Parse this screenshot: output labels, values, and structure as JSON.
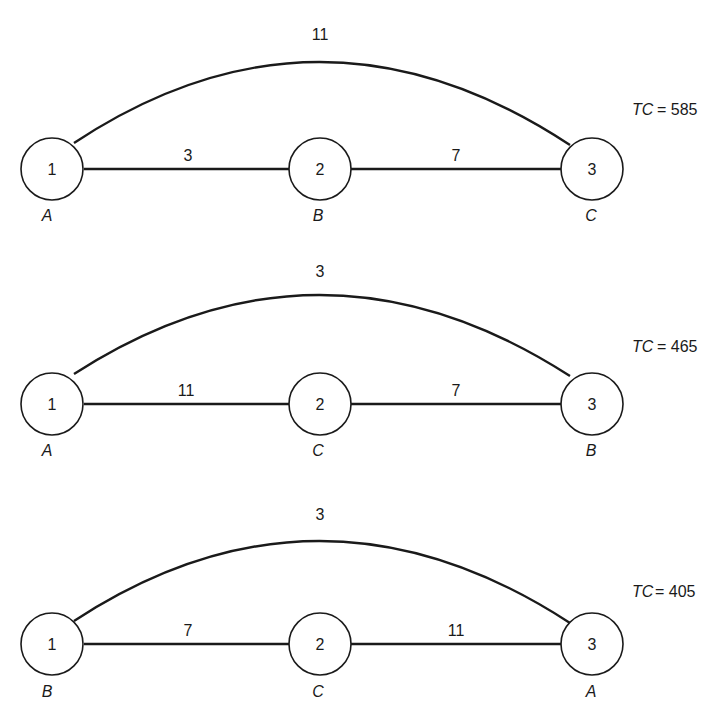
{
  "diagrams": [
    {
      "nodes": [
        {
          "number": "1",
          "letter": "A"
        },
        {
          "number": "2",
          "letter": "B"
        },
        {
          "number": "3",
          "letter": "C"
        }
      ],
      "edges": {
        "one_two": "3",
        "two_three": "7",
        "arc": "11"
      },
      "tc_label": "TC",
      "tc_eq": "= 585"
    },
    {
      "nodes": [
        {
          "number": "1",
          "letter": "A"
        },
        {
          "number": "2",
          "letter": "C"
        },
        {
          "number": "3",
          "letter": "B"
        }
      ],
      "edges": {
        "one_two": "11",
        "two_three": "7",
        "arc": "3"
      },
      "tc_label": "TC",
      "tc_eq": "= 465"
    },
    {
      "nodes": [
        {
          "number": "1",
          "letter": "B"
        },
        {
          "number": "2",
          "letter": "C"
        },
        {
          "number": "3",
          "letter": "A"
        }
      ],
      "edges": {
        "one_two": "7",
        "two_three": "11",
        "arc": "3"
      },
      "tc_label": "TC",
      "tc_eq": "= 405"
    }
  ]
}
